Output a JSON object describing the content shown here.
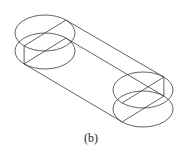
{
  "figure": {
    "caption": "(b)",
    "stroke_color": "#3a3a3a",
    "ellipse": {
      "rx": 30,
      "ry": 18
    },
    "ellipses": [
      {
        "name": "left-top-face",
        "cx": 45,
        "cy": 33
      },
      {
        "name": "left-bottom-face",
        "cx": 45,
        "cy": 51
      },
      {
        "name": "right-top-face",
        "cx": 143,
        "cy": 90
      },
      {
        "name": "right-bottom-face",
        "cx": 143,
        "cy": 109
      }
    ]
  }
}
